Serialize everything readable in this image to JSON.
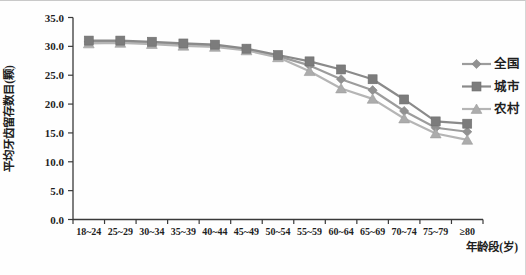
{
  "chart_data": {
    "type": "line",
    "title": "",
    "xlabel": "年龄段(岁)",
    "ylabel": "平均牙齿留存数目(颗)",
    "ylim": [
      0,
      35
    ],
    "ytick_labels": [
      "0.0",
      "5.0",
      "10.0",
      "15.0",
      "20.0",
      "25.0",
      "30.0",
      "35.0"
    ],
    "grid": false,
    "legend_position": "right",
    "categories": [
      "18~24",
      "25~29",
      "30~34",
      "35~39",
      "40~44",
      "45~49",
      "50~54",
      "55~59",
      "60~64",
      "65~69",
      "70~74",
      "75~79",
      "≥80"
    ],
    "series": [
      {
        "name": "全国",
        "marker": "diamond",
        "line_color": "#9c9c9c",
        "marker_color": "#919191",
        "values": [
          30.8,
          30.8,
          30.6,
          30.3,
          30.1,
          29.5,
          28.3,
          26.7,
          24.3,
          22.4,
          18.8,
          15.9,
          15.2
        ]
      },
      {
        "name": "城市",
        "marker": "square",
        "line_color": "#8a8a8a",
        "marker_color": "#7c7c7c",
        "values": [
          31.0,
          31.0,
          30.8,
          30.5,
          30.3,
          29.6,
          28.5,
          27.4,
          26.0,
          24.3,
          20.8,
          17.0,
          16.6
        ]
      },
      {
        "name": "农村",
        "marker": "triangle",
        "line_color": "#b5b5b5",
        "marker_color": "#acacac",
        "values": [
          30.5,
          30.6,
          30.4,
          30.1,
          29.9,
          29.3,
          28.1,
          25.7,
          22.7,
          20.9,
          17.5,
          14.9,
          13.8
        ]
      }
    ],
    "axis_color": "#3a3a3a",
    "text_color": "#1f1f1f"
  }
}
